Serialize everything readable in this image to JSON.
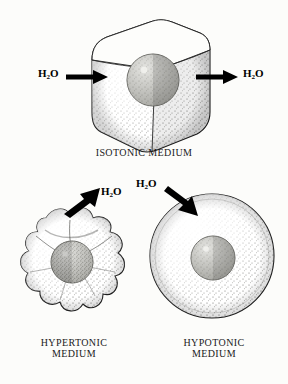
{
  "diagram": {
    "background_color": "#fcfcfa",
    "ink_color": "#111111",
    "nucleus_color": "#9a9a95"
  },
  "panels": [
    {
      "id": "isotonic",
      "caption": "ISOTONIC MEDIUM",
      "cell_shape": "rounded-cube",
      "cell_state": "normal",
      "nucleus": "sphere",
      "water_labels": [
        {
          "text": "H",
          "subscript": "2",
          "text_end": "O",
          "full": "H2O",
          "side": "left",
          "direction": "into-cell"
        },
        {
          "text": "H",
          "subscript": "2",
          "text_end": "O",
          "full": "H2O",
          "side": "right",
          "direction": "out-of-cell"
        }
      ],
      "arrows": [
        {
          "name": "water-in-arrow",
          "direction": "right"
        },
        {
          "name": "water-out-arrow",
          "direction": "right"
        }
      ]
    },
    {
      "id": "hypertonic",
      "caption": "HYPERTONIC\nMEDIUM",
      "cell_shape": "crenated-star",
      "cell_state": "shriveled",
      "nucleus": "sphere",
      "water_labels": [
        {
          "text": "H",
          "subscript": "2",
          "text_end": "O",
          "full": "H2O",
          "side": "top-right",
          "direction": "out-of-cell"
        }
      ],
      "arrows": [
        {
          "name": "water-out-arrow",
          "direction": "up-right"
        }
      ]
    },
    {
      "id": "hypotonic",
      "caption": "HYPOTONIC\nMEDIUM",
      "cell_shape": "round",
      "cell_state": "swollen",
      "nucleus": "sphere",
      "water_labels": [
        {
          "text": "H",
          "subscript": "2",
          "text_end": "O",
          "full": "H2O",
          "side": "top-left",
          "direction": "into-cell"
        }
      ],
      "arrows": [
        {
          "name": "water-in-arrow",
          "direction": "down-right"
        }
      ]
    }
  ],
  "labels": {
    "h2o_main": "H",
    "h2o_sub": "2",
    "h2o_tail": "O",
    "isotonic_caption": "ISOTONIC MEDIUM",
    "hypertonic_caption": "HYPERTONIC\nMEDIUM",
    "hypotonic_caption": "HYPOTONIC\nMEDIUM"
  }
}
